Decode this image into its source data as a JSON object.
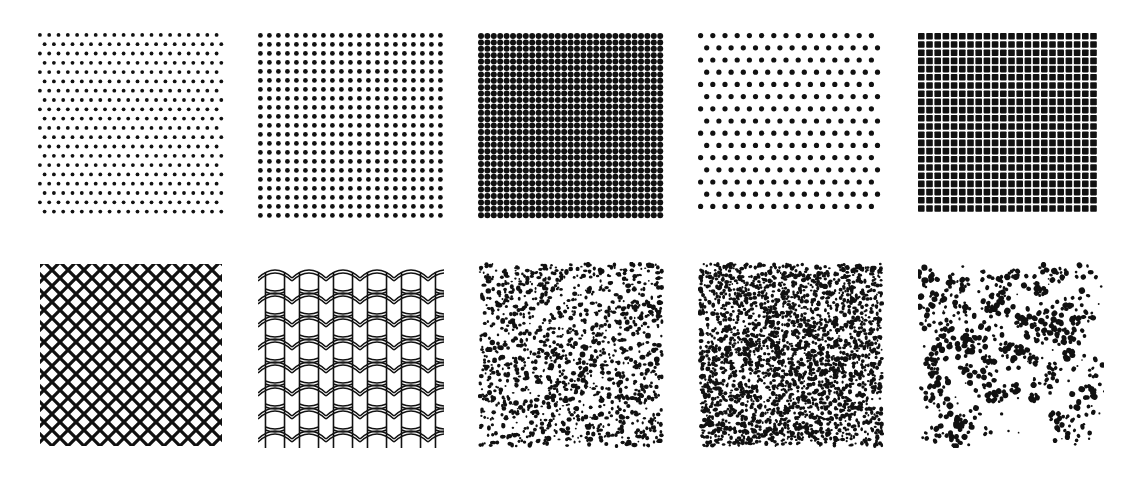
{
  "figure": {
    "background": "#ffffff",
    "ink": "#111111",
    "rows": 2,
    "cols": 5,
    "tile_size": 186,
    "tiles": [
      {
        "id": "dots-staggered-fine",
        "row": 0,
        "col": 0,
        "x": 38,
        "y": 33,
        "type": "dots",
        "pitch": 9.3,
        "radius": 1.9,
        "stagger": true
      },
      {
        "id": "dots-square-grid",
        "row": 0,
        "col": 1,
        "x": 258,
        "y": 33,
        "type": "dots",
        "pitch": 9.0,
        "radius": 2.4,
        "stagger": false
      },
      {
        "id": "dots-dense-grid",
        "row": 0,
        "col": 2,
        "x": 478,
        "y": 33,
        "type": "dots",
        "pitch": 6.4,
        "radius": 3.0,
        "stagger": false
      },
      {
        "id": "dots-diagonal",
        "row": 0,
        "col": 3,
        "x": 698,
        "y": 33,
        "type": "dots",
        "pitch": 12.2,
        "radius": 2.6,
        "stagger": true
      },
      {
        "id": "squares-grid",
        "row": 0,
        "col": 4,
        "x": 918,
        "y": 33,
        "type": "squares",
        "pitch": 8.2,
        "size": 6.6
      },
      {
        "id": "diamond-lattice",
        "row": 1,
        "col": 0,
        "x": 38,
        "y": 262,
        "type": "lattice",
        "pitch": 16.0,
        "stroke": 3.2
      },
      {
        "id": "roof-tiles",
        "row": 1,
        "col": 1,
        "x": 258,
        "y": 262,
        "type": "tiles",
        "cell_w": 34,
        "cell_h": 23
      },
      {
        "id": "random-speckle-sparse",
        "row": 1,
        "col": 2,
        "x": 478,
        "y": 262,
        "type": "speckle",
        "count": 1300,
        "rmin": 0.9,
        "rmax": 2.2,
        "seed": 11
      },
      {
        "id": "random-speckle-dense",
        "row": 1,
        "col": 3,
        "x": 698,
        "y": 262,
        "type": "speckle",
        "count": 2600,
        "rmin": 1.0,
        "rmax": 2.0,
        "seed": 23
      },
      {
        "id": "leopard-rosettes",
        "row": 1,
        "col": 4,
        "x": 918,
        "y": 262,
        "type": "rosettes",
        "count": 120,
        "seed": 7
      }
    ]
  }
}
